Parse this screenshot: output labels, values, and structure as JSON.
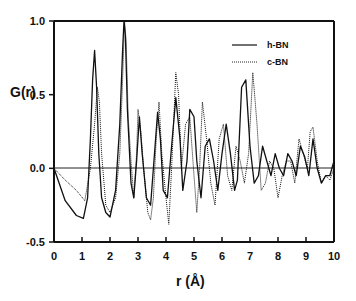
{
  "chart_data": {
    "type": "line",
    "title": "",
    "xlabel": "r (Å)",
    "ylabel": "G(r)",
    "xlim": [
      0,
      10
    ],
    "ylim": [
      -0.5,
      1.0
    ],
    "xticks": [
      "0",
      "1",
      "2",
      "3",
      "4",
      "5",
      "6",
      "7",
      "8",
      "9",
      "10"
    ],
    "yticks": [
      "1.0",
      "0.5",
      "0.0",
      "-0.5"
    ],
    "grid": false,
    "legend_position": "upper right",
    "zero_line": true,
    "series": [
      {
        "name": "h-BN",
        "style": "solid",
        "x": [
          0.0,
          0.4,
          0.8,
          1.05,
          1.2,
          1.3,
          1.38,
          1.45,
          1.52,
          1.6,
          1.7,
          1.85,
          2.0,
          2.2,
          2.35,
          2.45,
          2.5,
          2.55,
          2.62,
          2.75,
          2.85,
          2.95,
          3.05,
          3.15,
          3.3,
          3.45,
          3.55,
          3.7,
          3.8,
          3.9,
          4.05,
          4.2,
          4.35,
          4.5,
          4.6,
          4.75,
          4.85,
          5.0,
          5.1,
          5.25,
          5.4,
          5.55,
          5.7,
          5.85,
          6.0,
          6.15,
          6.3,
          6.45,
          6.55,
          6.7,
          6.85,
          7.0,
          7.15,
          7.3,
          7.45,
          7.6,
          7.75,
          7.9,
          8.05,
          8.2,
          8.35,
          8.5,
          8.65,
          8.8,
          8.95,
          9.1,
          9.25,
          9.4,
          9.55,
          9.7,
          9.85,
          10.0
        ],
        "y": [
          0.0,
          -0.22,
          -0.32,
          -0.34,
          -0.2,
          0.2,
          0.6,
          0.8,
          0.55,
          0.1,
          -0.2,
          -0.3,
          -0.33,
          -0.15,
          0.3,
          0.8,
          1.0,
          0.9,
          0.4,
          -0.1,
          -0.2,
          0.05,
          0.35,
          0.1,
          -0.2,
          -0.25,
          0.0,
          0.38,
          0.2,
          -0.15,
          -0.2,
          0.15,
          0.48,
          0.2,
          -0.15,
          0.05,
          0.4,
          0.35,
          0.05,
          -0.2,
          0.15,
          0.2,
          0.05,
          -0.15,
          0.1,
          0.3,
          0.1,
          -0.15,
          -0.08,
          0.55,
          0.6,
          0.15,
          -0.1,
          -0.05,
          0.15,
          0.05,
          -0.05,
          0.1,
          0.0,
          -0.05,
          0.1,
          0.05,
          -0.05,
          0.15,
          0.08,
          -0.05,
          0.2,
          0.0,
          -0.1,
          -0.05,
          -0.05,
          0.05
        ]
      },
      {
        "name": "c-BN",
        "style": "dotted",
        "x": [
          0.0,
          0.4,
          0.8,
          1.1,
          1.3,
          1.45,
          1.55,
          1.62,
          1.7,
          1.85,
          2.0,
          2.2,
          2.35,
          2.45,
          2.52,
          2.58,
          2.65,
          2.75,
          2.85,
          2.95,
          3.0,
          3.1,
          3.2,
          3.35,
          3.45,
          3.55,
          3.65,
          3.75,
          3.85,
          4.0,
          4.1,
          4.2,
          4.35,
          4.45,
          4.55,
          4.7,
          4.85,
          5.0,
          5.1,
          5.2,
          5.3,
          5.45,
          5.6,
          5.75,
          5.9,
          6.05,
          6.2,
          6.35,
          6.5,
          6.65,
          6.8,
          6.95,
          7.1,
          7.25,
          7.4,
          7.55,
          7.7,
          7.85,
          8.0,
          8.15,
          8.3,
          8.45,
          8.6,
          8.75,
          8.9,
          9.05,
          9.15,
          9.25,
          9.4,
          9.55,
          9.7,
          9.85,
          10.0
        ],
        "y": [
          0.0,
          -0.08,
          -0.15,
          -0.22,
          0.0,
          0.3,
          0.55,
          0.45,
          0.1,
          -0.25,
          -0.3,
          -0.2,
          0.1,
          0.6,
          1.0,
          0.85,
          0.35,
          0.05,
          -0.2,
          0.1,
          0.4,
          0.25,
          0.0,
          -0.3,
          -0.35,
          -0.2,
          0.2,
          0.45,
          0.1,
          -0.2,
          -0.38,
          0.0,
          0.65,
          0.5,
          0.0,
          0.3,
          0.35,
          -0.05,
          -0.3,
          0.0,
          0.45,
          0.2,
          -0.1,
          -0.25,
          0.2,
          0.3,
          -0.05,
          -0.15,
          0.15,
          0.05,
          -0.1,
          0.1,
          0.65,
          0.3,
          -0.15,
          -0.1,
          0.05,
          0.0,
          -0.2,
          -0.05,
          0.05,
          0.05,
          -0.1,
          0.2,
          0.1,
          0.0,
          0.25,
          0.28,
          0.05,
          -0.1,
          -0.05,
          -0.08,
          0.0
        ]
      }
    ]
  },
  "legend": {
    "items": [
      {
        "label": "h-BN",
        "style": "solid"
      },
      {
        "label": "c-BN",
        "style": "dotted"
      }
    ]
  },
  "axes": {
    "ylabel": "G(r)",
    "xlabel": "r (Å)"
  }
}
